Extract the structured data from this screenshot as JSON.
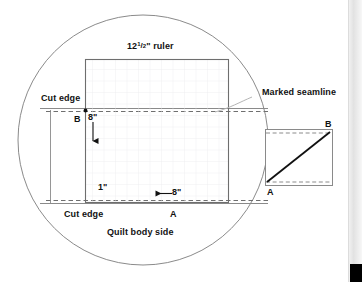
{
  "page": {
    "background_color": "#ffffff",
    "ink_color": "#111111",
    "line_color": "#555555",
    "grid_color": "#e7e7ea",
    "dash_color": "#7a7a7a"
  },
  "diagram": {
    "magnifier_circle": {
      "present": true,
      "cx": 143,
      "cy": 140,
      "r": 125
    },
    "ruler": {
      "label": "12",
      "fraction_numerator": "1",
      "fraction_slash": "/",
      "fraction_denominator": "2",
      "unit": "\"",
      "label_suffix": "ruler",
      "full_label": "12 1/2\" ruler",
      "grid": true
    },
    "labels": {
      "cut_edge_top": "Cut edge",
      "cut_edge_bottom": "Cut edge",
      "quilt_body_side": "Quilt body side",
      "marked_seamline": "Marked seamline",
      "point_b_left": "B",
      "point_a_bottom": "A",
      "point_b_right": "B",
      "point_a_right": "A",
      "measure_vertical": "8\"",
      "measure_horizontal": "8\"",
      "measure_seam_allowance": "1\""
    },
    "annotations": [
      {
        "name": "vertical-8in-arrow",
        "direction": "down",
        "value": "8\""
      },
      {
        "name": "horizontal-8in-arrow",
        "direction": "left",
        "value": "8\""
      },
      {
        "name": "seamline-leader",
        "from": "Marked seamline",
        "to": "seamline"
      }
    ],
    "detail_panel": {
      "description": "Folded strip with diagonal A-to-B stitching line",
      "point_top_right": "B",
      "point_bottom_left": "A"
    }
  },
  "scrollbar": {
    "name": "vertical-scrollbar",
    "thumb_position": "bottom"
  }
}
